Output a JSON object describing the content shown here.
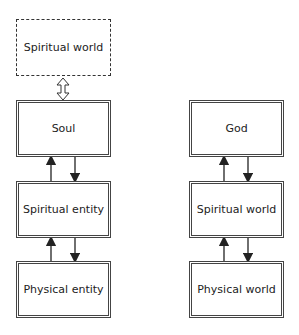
{
  "diagram": {
    "left_column": {
      "top_optional": "Spiritual world",
      "nodes": [
        "Soul",
        "Spiritual entity",
        "Physical entity"
      ]
    },
    "right_column": {
      "nodes": [
        "God",
        "Spiritual world",
        "Physical world"
      ]
    },
    "colors": {
      "line": "#333333",
      "text": "#222222",
      "background": "#ffffff"
    }
  }
}
